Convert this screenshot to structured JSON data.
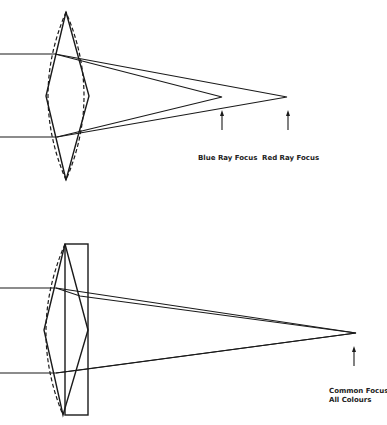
{
  "diagram": {
    "top": {
      "title": "Chromatic aberration - single lens",
      "labels": {
        "blue_focus": "Blue Ray Focus",
        "red_focus": "Red Ray Focus"
      }
    },
    "bottom": {
      "title": "Achromatic doublet",
      "labels": {
        "common_focus_line1": "Common Focus",
        "common_focus_line2": "All Colours"
      }
    },
    "colors": {
      "ink": "#1a1a1a",
      "background": "#ffffff"
    }
  }
}
